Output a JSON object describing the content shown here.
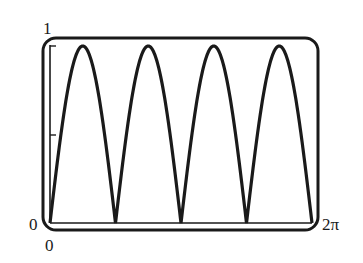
{
  "chart_data": {
    "type": "line",
    "title": "",
    "xlabel": "",
    "ylabel": "",
    "function": "|sin(2x)|",
    "xlim": [
      0,
      6.2832
    ],
    "ylim": [
      0,
      1
    ],
    "x_tick_labels": [
      "0",
      "2π"
    ],
    "y_tick_labels": [
      "0",
      "0.5",
      "1"
    ],
    "y_tick_labels_shown": [
      "0",
      "1"
    ],
    "grid": false,
    "legend": null,
    "series": [
      {
        "name": "|sin(2x)|",
        "x": [
          0,
          0.3927,
          0.7854,
          1.1781,
          1.5708,
          1.9635,
          2.3562,
          2.7489,
          3.1416,
          3.5343,
          3.927,
          4.3197,
          4.7124,
          5.1051,
          5.4978,
          5.8905,
          6.2832
        ],
        "values": [
          0,
          0.707,
          1,
          0.707,
          0,
          0.707,
          1,
          0.707,
          0,
          0.707,
          1,
          0.707,
          0,
          0.707,
          1,
          0.707,
          0
        ]
      }
    ],
    "peaks": [
      0.7854,
      2.3562,
      3.927,
      5.4978
    ],
    "zeros": [
      0,
      1.5708,
      3.1416,
      4.7124,
      6.2832
    ]
  },
  "labels": {
    "y_max": "1",
    "y_min": "0",
    "x_min": "0",
    "x_max": "2π"
  },
  "style": {
    "stroke_color": "#1a1a1a",
    "background": "#ffffff"
  }
}
